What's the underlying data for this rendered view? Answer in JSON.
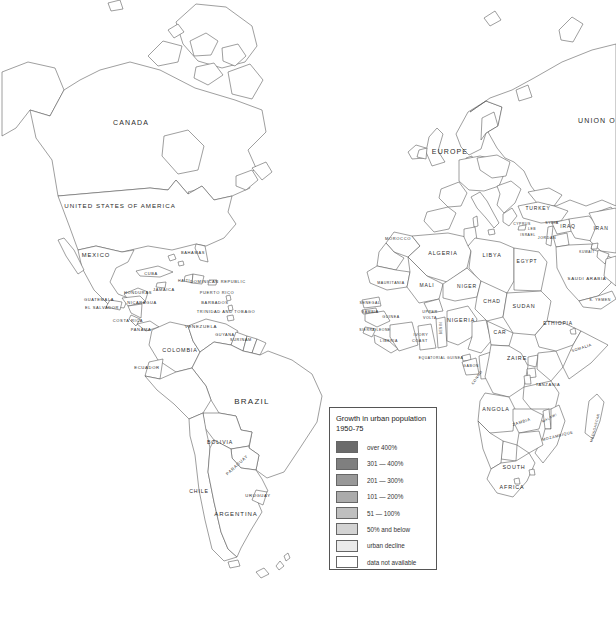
{
  "palette": {
    "ocean": "#ffffff",
    "coastline": "#4f4f4f",
    "label": "#2b2b2b"
  },
  "legend": {
    "title": "Growth in urban population",
    "subtitle": "1950-75",
    "items": [
      {
        "label": "over 400%",
        "color": "#6b6b6b"
      },
      {
        "label": "301 — 400%",
        "color": "#7f7f7f"
      },
      {
        "label": "201 — 300%",
        "color": "#989898"
      },
      {
        "label": "101 — 200%",
        "color": "#ababab"
      },
      {
        "label": "51 — 100%",
        "color": "#bfbfbf"
      },
      {
        "label": "50% and below",
        "color": "#d3d3d3"
      },
      {
        "label": "urban decline",
        "color": "#eaeaea"
      },
      {
        "label": "data not available",
        "color": "#ffffff"
      }
    ]
  },
  "map": {
    "labels": [
      {
        "t": "CANADA",
        "x": 131,
        "y": 125,
        "s": 7
      },
      {
        "t": "UNITED STATES OF AMERICA",
        "x": 120,
        "y": 208,
        "s": 6.2
      },
      {
        "t": "MEXICO",
        "x": 96,
        "y": 257,
        "s": 5.8
      },
      {
        "t": "BAHAMAS",
        "x": 193,
        "y": 254,
        "s": 4
      },
      {
        "t": "CUBA",
        "x": 151,
        "y": 275,
        "s": 4
      },
      {
        "t": "JAMAICA",
        "x": 164,
        "y": 291,
        "s": 4
      },
      {
        "t": "HAITI",
        "x": 184,
        "y": 282,
        "s": 3.6
      },
      {
        "t": "DOMINICAN REPUBLIC",
        "x": 218,
        "y": 283,
        "s": 4
      },
      {
        "t": "PUERTO RICO",
        "x": 217,
        "y": 294,
        "s": 4
      },
      {
        "t": "BARBADOS",
        "x": 215,
        "y": 304,
        "s": 4
      },
      {
        "t": "TRINIDAD AND TOBAGO",
        "x": 226,
        "y": 313,
        "s": 4
      },
      {
        "t": "GUATEMALA",
        "x": 99,
        "y": 301,
        "s": 4
      },
      {
        "t": "EL SALVADOR",
        "x": 102,
        "y": 309,
        "s": 4
      },
      {
        "t": "HONDURAS",
        "x": 138,
        "y": 294,
        "s": 4
      },
      {
        "t": "NICARAGUA",
        "x": 142,
        "y": 304,
        "s": 4
      },
      {
        "t": "COSTA RICA",
        "x": 128,
        "y": 322,
        "s": 4
      },
      {
        "t": "PANAMA",
        "x": 141,
        "y": 331,
        "s": 4
      },
      {
        "t": "VENEZUELA",
        "x": 201,
        "y": 328,
        "s": 4.4
      },
      {
        "t": "GUYANA",
        "x": 225,
        "y": 336,
        "s": 3.8
      },
      {
        "t": "SURINAM",
        "x": 241,
        "y": 341,
        "s": 3.8
      },
      {
        "t": "COLOMBIA",
        "x": 180,
        "y": 352,
        "s": 5.4
      },
      {
        "t": "ECUADOR",
        "x": 147,
        "y": 369,
        "s": 4.2
      },
      {
        "t": "BRAZIL",
        "x": 252,
        "y": 404,
        "s": 8
      },
      {
        "t": "BOLIVIA",
        "x": 220,
        "y": 444,
        "s": 5.2
      },
      {
        "t": "PARAGUAY",
        "x": 238,
        "y": 466,
        "s": 4.2,
        "r": -42
      },
      {
        "t": "CHILE",
        "x": 199,
        "y": 493,
        "s": 5.2
      },
      {
        "t": "URUGUAY",
        "x": 258,
        "y": 497,
        "s": 4.2
      },
      {
        "t": "ARGENTINA",
        "x": 236,
        "y": 516,
        "s": 6
      },
      {
        "t": "EUROPE",
        "x": 450,
        "y": 154,
        "s": 7
      },
      {
        "t": "UNION O",
        "x": 597,
        "y": 123,
        "s": 7
      },
      {
        "t": "TURKEY",
        "x": 538,
        "y": 210,
        "s": 5
      },
      {
        "t": "CYPRUS",
        "x": 522,
        "y": 225,
        "s": 3.4
      },
      {
        "t": "LEB",
        "x": 532,
        "y": 230,
        "s": 3.4
      },
      {
        "t": "SYRIA",
        "x": 552,
        "y": 224,
        "s": 3.6
      },
      {
        "t": "ISRAEL",
        "x": 528,
        "y": 236,
        "s": 3.4
      },
      {
        "t": "JORDAN",
        "x": 547,
        "y": 239,
        "s": 3.6
      },
      {
        "t": "IRAQ",
        "x": 568,
        "y": 228,
        "s": 5
      },
      {
        "t": "IRAN",
        "x": 601,
        "y": 230,
        "s": 5
      },
      {
        "t": "KUWAIT",
        "x": 587,
        "y": 253,
        "s": 3.2
      },
      {
        "t": "SAUDI ARABIA",
        "x": 587,
        "y": 280,
        "s": 4.4
      },
      {
        "t": "S. YEMEN",
        "x": 600,
        "y": 301,
        "s": 3.6
      },
      {
        "t": "MOROCCO",
        "x": 398,
        "y": 240,
        "s": 4
      },
      {
        "t": "ALGERIA",
        "x": 443,
        "y": 255,
        "s": 5.4
      },
      {
        "t": "LIBYA",
        "x": 492,
        "y": 257,
        "s": 5.4
      },
      {
        "t": "EGYPT",
        "x": 527,
        "y": 263,
        "s": 5
      },
      {
        "t": "MAURITANIA",
        "x": 391,
        "y": 284,
        "s": 3.6
      },
      {
        "t": "MALI",
        "x": 427,
        "y": 287,
        "s": 5
      },
      {
        "t": "NIGER",
        "x": 467,
        "y": 288,
        "s": 5
      },
      {
        "t": "CHAD",
        "x": 492,
        "y": 303,
        "s": 5
      },
      {
        "t": "SUDAN",
        "x": 524,
        "y": 308,
        "s": 5.4
      },
      {
        "t": "SENEGAL",
        "x": 370,
        "y": 304,
        "s": 3.6
      },
      {
        "t": "GAMBIA",
        "x": 370,
        "y": 313,
        "s": 3.6
      },
      {
        "t": "GUINEA",
        "x": 391,
        "y": 318,
        "s": 3.6
      },
      {
        "t": "SIERRA LEONE",
        "x": 375,
        "y": 331,
        "s": 3.4
      },
      {
        "t": "LIBERIA",
        "x": 389,
        "y": 342,
        "s": 3.6
      },
      {
        "t": "IVORY",
        "x": 421,
        "y": 336,
        "s": 3.8
      },
      {
        "t": "COAST",
        "x": 420,
        "y": 342,
        "s": 3.8
      },
      {
        "t": "UPPER",
        "x": 430,
        "y": 313,
        "s": 3.6
      },
      {
        "t": "VOLTA",
        "x": 430,
        "y": 319,
        "s": 3.6
      },
      {
        "t": "BENIN",
        "x": 442,
        "y": 328,
        "s": 3.2,
        "r": -90
      },
      {
        "t": "NIGERIA",
        "x": 461,
        "y": 322,
        "s": 5.4
      },
      {
        "t": "CAR",
        "x": 500,
        "y": 334,
        "s": 5
      },
      {
        "t": "ETHIOPIA",
        "x": 558,
        "y": 325,
        "s": 5
      },
      {
        "t": "SOMALIA",
        "x": 582,
        "y": 349,
        "s": 3.8,
        "r": -18
      },
      {
        "t": "EQUATORIAL GUINEA",
        "x": 441,
        "y": 359,
        "s": 3.4
      },
      {
        "t": "GABON",
        "x": 471,
        "y": 367,
        "s": 3.6
      },
      {
        "t": "CONGO",
        "x": 478,
        "y": 378,
        "s": 3.6,
        "r": -55
      },
      {
        "t": "ZAIRE",
        "x": 517,
        "y": 360,
        "s": 5.4
      },
      {
        "t": "TANZANIA",
        "x": 548,
        "y": 386,
        "s": 4
      },
      {
        "t": "ANGOLA",
        "x": 496,
        "y": 411,
        "s": 5.4
      },
      {
        "t": "ZAMBIA",
        "x": 522,
        "y": 423,
        "s": 4,
        "r": -18
      },
      {
        "t": "MALAWI",
        "x": 550,
        "y": 419,
        "s": 3.4,
        "r": -28
      },
      {
        "t": "MOZAMBIQUE",
        "x": 558,
        "y": 437,
        "s": 3.8,
        "r": -14
      },
      {
        "t": "SOUTH",
        "x": 514,
        "y": 469,
        "s": 5.4
      },
      {
        "t": "AFRICA",
        "x": 512,
        "y": 489,
        "s": 5.4
      },
      {
        "t": "MADAGASCAR",
        "x": 596,
        "y": 428,
        "s": 3.4,
        "r": -75
      }
    ]
  }
}
